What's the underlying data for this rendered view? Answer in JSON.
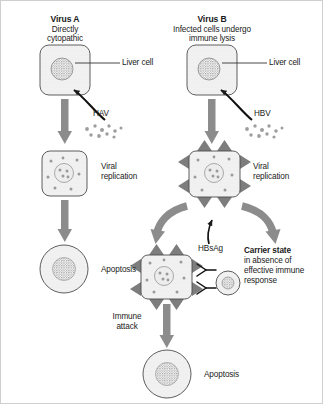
{
  "figure": {
    "width": 323,
    "height": 404,
    "background": "#ffffff",
    "border_color": "#cfcfcf"
  },
  "colors": {
    "arrow_gray": "#8c8c8c",
    "spike_gray": "#7d7d7d",
    "cell_fill": "#f0f0f0",
    "cell_stroke": "#555555",
    "nucleus_gray": "#9a9a9a",
    "particle_gray": "#9e9e9e",
    "text": "#1a1a1a",
    "leader_line": "#333333"
  },
  "columns": {
    "left": {
      "title": "Virus A",
      "subtitle_line1": "Directly",
      "subtitle_line2": "cytopathic",
      "virus_label": "HAV",
      "steps": [
        {
          "label": "Liver cell"
        },
        {
          "label_line1": "Viral",
          "label_line2": "replication"
        },
        {
          "label": "Apoptosis"
        }
      ]
    },
    "right": {
      "title": "Virus B",
      "subtitle_line1": "Infected cells undergo",
      "subtitle_line2": "immune lysis",
      "virus_label": "HBV",
      "steps": [
        {
          "label": "Liver cell"
        },
        {
          "label_line1": "Viral",
          "label_line2": "replication"
        },
        {
          "label": "Apoptosis"
        }
      ],
      "antigen_label": "HBsAg",
      "immune_attack_line1": "Immune",
      "immune_attack_line2": "attack",
      "carrier": {
        "heading": "Carrier state",
        "line1": "in absence of",
        "line2": "effective immune",
        "line3": "response"
      }
    }
  },
  "icons": {
    "liver_cell": "rounded-square-cell-icon",
    "nucleus": "stippled-nucleus-icon",
    "virus_particles": "virus-particle-cluster-icon",
    "spiked_cell": "spiked-infected-cell-icon",
    "apoptotic_cell": "apoptotic-round-cell-icon",
    "lymphocyte": "lymphocyte-icon",
    "antibody": "y-shaped-antibody-icon",
    "arrow_down": "down-arrow-icon",
    "arrow_curved": "curved-arrow-icon",
    "leader": "leader-line-icon"
  }
}
